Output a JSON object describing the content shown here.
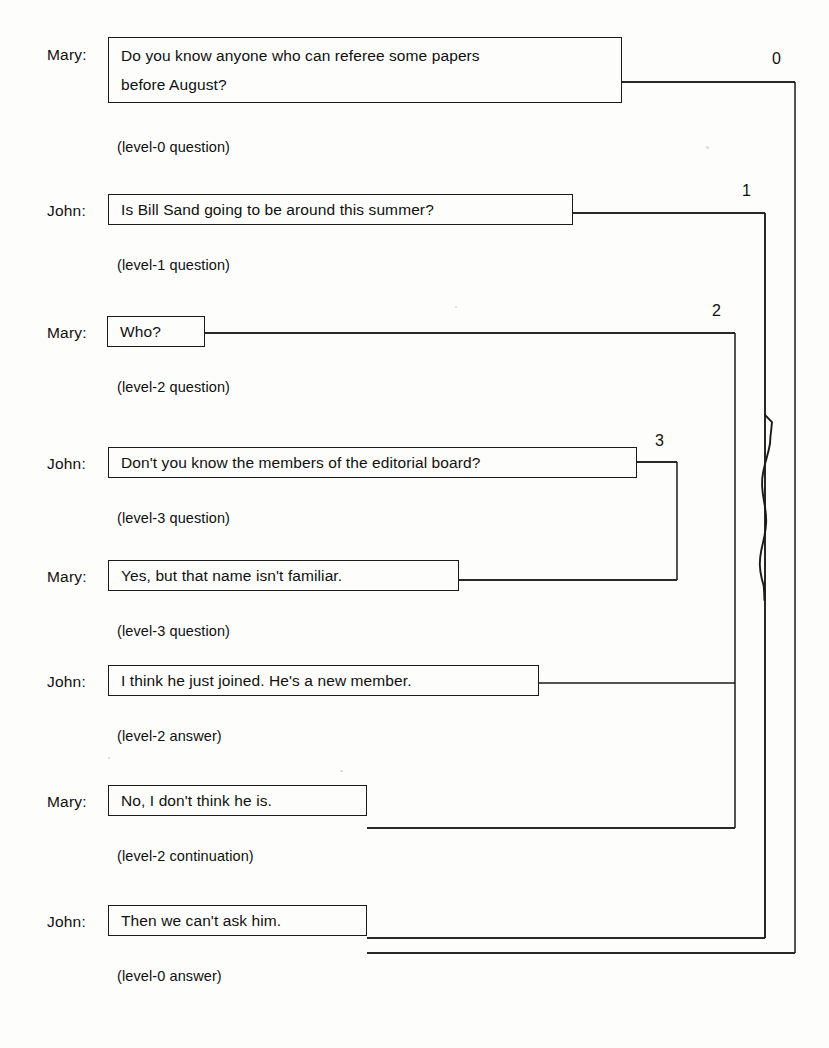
{
  "figure": {
    "type": "dialogue-nesting-diagram",
    "background_color": "#fdfdfb",
    "line_color": "#1a1a1a"
  },
  "turns": [
    {
      "speaker": "Mary:",
      "lines": [
        "Do you know anyone who can referee some papers",
        "before August?"
      ],
      "annotation": "(level-0 question)",
      "box": {
        "x": 108,
        "y": 37,
        "w": 514,
        "h": 66
      },
      "speaker_y": 46,
      "annotation_y": 139,
      "connector_y": 82,
      "level": 0
    },
    {
      "speaker": "John:",
      "lines": [
        "Is Bill Sand going to be around this summer?"
      ],
      "annotation": "(level-1 question)",
      "box": {
        "x": 108,
        "y": 194,
        "w": 465,
        "h": 31
      },
      "speaker_y": 202,
      "annotation_y": 257,
      "connector_y": 210,
      "level": 1
    },
    {
      "speaker": "Mary:",
      "lines": [
        "Who?"
      ],
      "annotation": "(level-2 question)",
      "box": {
        "x": 107,
        "y": 316,
        "w": 98,
        "h": 31
      },
      "speaker_y": 324,
      "annotation_y": 379,
      "connector_y": 333,
      "level": 2
    },
    {
      "speaker": "John:",
      "lines": [
        "Don't you know the members of the editorial board?"
      ],
      "annotation": "(level-3 question)",
      "box": {
        "x": 108,
        "y": 447,
        "w": 529,
        "h": 31
      },
      "speaker_y": 455,
      "annotation_y": 510,
      "connector_y": 462,
      "level": 3
    },
    {
      "speaker": "Mary:",
      "lines": [
        "Yes, but that name isn't familiar."
      ],
      "annotation": "(level-3 question)",
      "box": {
        "x": 108,
        "y": 560,
        "w": 351,
        "h": 31
      },
      "speaker_y": 568,
      "annotation_y": 623,
      "connector_y": 580,
      "level": 3
    },
    {
      "speaker": "John:",
      "lines": [
        "I think he just joined. He's a new member."
      ],
      "annotation": "(level-2 answer)",
      "box": {
        "x": 108,
        "y": 665,
        "w": 431,
        "h": 31
      },
      "speaker_y": 673,
      "annotation_y": 728,
      "connector_y": 683,
      "level": 2
    },
    {
      "speaker": "Mary:",
      "lines": [
        "No, I don't think he is."
      ],
      "annotation": "(level-2 continuation)",
      "box": {
        "x": 108,
        "y": 785,
        "w": 259,
        "h": 31
      },
      "speaker_y": 793,
      "annotation_y": 848,
      "connector_y": 828,
      "level": 2
    },
    {
      "speaker": "John:",
      "lines": [
        "Then we can't ask him."
      ],
      "annotation": "(level-0 answer)",
      "box": {
        "x": 108,
        "y": 905,
        "w": 259,
        "h": 31
      },
      "speaker_y": 913,
      "annotation_y": 968,
      "connector_y": 953,
      "level": 0
    }
  ],
  "levels": [
    {
      "label": "0",
      "x": 795,
      "label_x": 772,
      "label_y": 50,
      "open_y": 82,
      "close_y": 953,
      "open_from_x": 622,
      "close_to_x": 367
    },
    {
      "label": "1",
      "x": 765,
      "label_x": 742,
      "label_y": 182,
      "open_y": 213,
      "close_y": 938,
      "open_from_x": 573,
      "close_to_x": 367
    },
    {
      "label": "2",
      "x": 735,
      "label_x": 712,
      "label_y": 302,
      "open_y": 333,
      "close_y": 828,
      "open_from_x": 205,
      "close_to_x": 367
    },
    {
      "label": "3",
      "x": 677,
      "label_x": 655,
      "label_y": 432,
      "open_y": 462,
      "close_y": 580,
      "open_from_x": 637,
      "close_to_x": 459
    }
  ],
  "artifact": {
    "name": "scan-squiggle",
    "x": 765,
    "y_start": 415,
    "y_end": 600
  }
}
